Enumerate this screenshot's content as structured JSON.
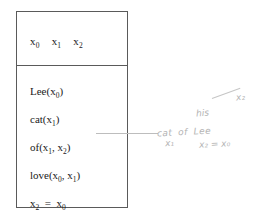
{
  "diagram": {
    "type": "discourse-representation-structure",
    "box": {
      "universe": {
        "label": "discourse-referents",
        "referents": [
          "x0",
          "x1",
          "x2"
        ],
        "rendered": [
          "x₀",
          "x₁",
          "x₂"
        ]
      },
      "conditions": [
        {
          "id": "cond-lee",
          "text": "Lee(x₀)",
          "predicate": "Lee",
          "args": [
            "x0"
          ]
        },
        {
          "id": "cond-cat",
          "text": "cat(x₁)",
          "predicate": "cat",
          "args": [
            "x1"
          ]
        },
        {
          "id": "cond-of",
          "text": "of(x₁, x₂)",
          "predicate": "of",
          "args": [
            "x1",
            "x2"
          ]
        },
        {
          "id": "cond-love",
          "text": "love(x₀, x₁)",
          "predicate": "love",
          "args": [
            "x0",
            "x1"
          ]
        },
        {
          "id": "cond-eq",
          "text": "x₂  =  x₀",
          "predicate": "=",
          "args": [
            "x2",
            "x0"
          ]
        }
      ]
    },
    "annotation": {
      "label": "handwritten-gloss",
      "pointer_target": "of(x₁, x₂)",
      "above_word": "his",
      "gloss_words": [
        "cat",
        "of",
        "Lee"
      ],
      "sub_x1": "x₁",
      "sub_eq": "x₂ = x₀",
      "top_label": "x₂"
    },
    "colors": {
      "box_border": "#5a5a5a",
      "text": "#1a1a1a",
      "connector": "#bdbdbd",
      "handwriting": "#b4b4b4",
      "background": "#ffffff"
    }
  }
}
